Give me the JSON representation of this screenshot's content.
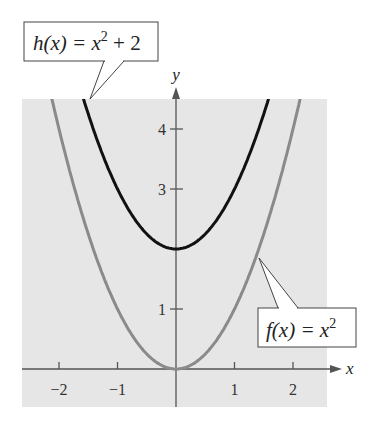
{
  "chart_data": {
    "type": "line",
    "title": "",
    "xlabel": "x",
    "ylabel": "y",
    "xlim": [
      -2.6,
      2.6
    ],
    "ylim": [
      -0.6,
      4.5
    ],
    "grid": false,
    "x_ticks": [
      -2,
      -1,
      1,
      2
    ],
    "x_tick_labels": [
      "−2",
      "−1",
      "1",
      "2"
    ],
    "y_ticks": [
      1,
      3,
      4
    ],
    "y_tick_labels": [
      "1",
      "3",
      "4"
    ],
    "series": [
      {
        "name": "f(x) = x^2",
        "formula": "x^2",
        "color": "#8a8a8a",
        "x": [
          -2.1,
          -2,
          -1.5,
          -1,
          -0.5,
          0,
          0.5,
          1,
          1.5,
          2,
          2.1
        ],
        "values": [
          4.41,
          4,
          2.25,
          1,
          0.25,
          0,
          0.25,
          1,
          2.25,
          4,
          4.41
        ]
      },
      {
        "name": "h(x) = x^2 + 2",
        "formula": "x^2 + 2",
        "color": "#111111",
        "x": [
          -1.6,
          -1.5,
          -1,
          -0.5,
          0,
          0.5,
          1,
          1.5,
          1.6
        ],
        "values": [
          4.56,
          4.25,
          3,
          2.25,
          2,
          2.25,
          3,
          4.25,
          4.56
        ]
      }
    ],
    "annotations": [
      {
        "text": "h(x) = x^2 + 2",
        "points_to": "h curve top-left"
      },
      {
        "text": "f(x) = x^2",
        "points_to": "f curve right side"
      }
    ]
  },
  "labels": {
    "x_axis": "x",
    "y_axis": "y",
    "xt": [
      "−2",
      "−1",
      "1",
      "2"
    ],
    "yt": [
      "1",
      "3",
      "4"
    ],
    "h_callout": {
      "pre": "h(x) = x",
      "exp": "2",
      "post": " + 2"
    },
    "f_callout": {
      "pre": "f(x) = x",
      "exp": "2"
    }
  },
  "colors": {
    "plot_bg": "#e6e6e6",
    "axis": "#555555",
    "f_curve": "#8a8a8a",
    "h_curve": "#111111"
  }
}
